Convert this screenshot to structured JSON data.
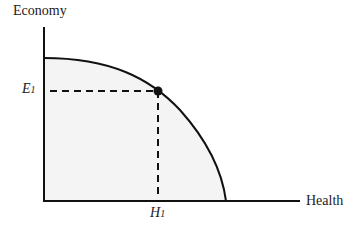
{
  "diagram": {
    "y_axis_label": "Economy",
    "x_axis_label": "Health",
    "point": {
      "y_label": "E",
      "y_label_sub": "1",
      "x_label": "H",
      "x_label_sub": "1"
    },
    "colors": {
      "line": "#111111",
      "fill": "#f4f4f4",
      "background": "#ffffff"
    }
  }
}
